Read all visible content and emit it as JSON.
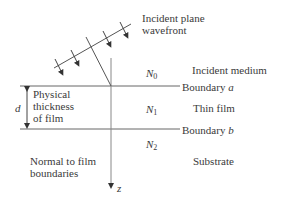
{
  "diagram": {
    "wavefront_label": [
      "Incident plane",
      "wavefront"
    ],
    "media": [
      {
        "symbol": "N",
        "subscript": "0",
        "name": "Incident medium"
      },
      {
        "symbol": "N",
        "subscript": "1",
        "name": "Thin film"
      },
      {
        "symbol": "N",
        "subscript": "2",
        "name": "Substrate"
      }
    ],
    "boundaries": [
      {
        "label": "Boundary",
        "letter": "a"
      },
      {
        "label": "Boundary",
        "letter": "b"
      }
    ],
    "thickness": {
      "symbol": "d",
      "label": [
        "Physical",
        "thickness",
        "of film"
      ]
    },
    "normal": {
      "label": [
        "Normal to film",
        "boundaries"
      ],
      "axis": "z"
    },
    "colors": {
      "line": "#555555",
      "text": "#3a3a3a"
    }
  }
}
